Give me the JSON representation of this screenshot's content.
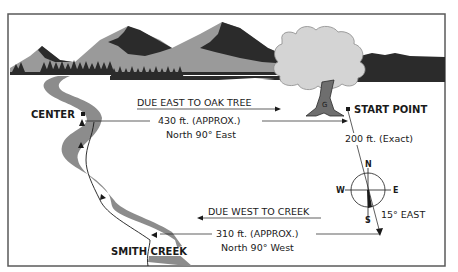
{
  "colors": {
    "frame": "#5a5a5a",
    "mountain_light": "#9a9a9a",
    "mountain_dark": "#2b2b2b",
    "creek": "#8c8c8c",
    "tree_foliage": "#d4d4d4",
    "tree_trunk": "#6e6e6e",
    "ink": "#1a1a1a"
  },
  "labels": {
    "center": "CENTER",
    "start_point": "START POINT",
    "smith_creek": "SMITH CREEK"
  },
  "east_leg": {
    "heading": "DUE EAST TO OAK TREE",
    "distance": "430 ft. (APPROX.)",
    "bearing": "North 90° East"
  },
  "south_leg": {
    "distance": "200 ft. (Exact)",
    "bearing": "15° EAST"
  },
  "west_leg": {
    "heading": "DUE WEST TO CREEK",
    "distance": "310 ft. (APPROX.)",
    "bearing": "North 90° West"
  },
  "compass": {
    "north": "N",
    "south": "S",
    "east": "E",
    "west": "W"
  },
  "tree_marker": "G"
}
